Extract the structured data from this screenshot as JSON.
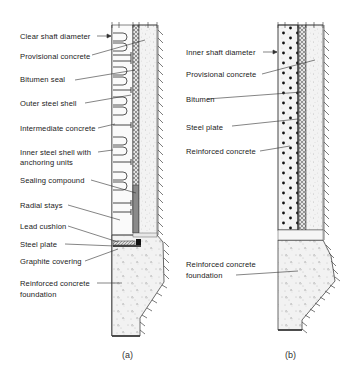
{
  "figure_a": {
    "caption": "(a)",
    "labels": [
      {
        "id": "clear-shaft-diameter",
        "text": "Clear shaft diameter",
        "x": 20,
        "y": 23
      },
      {
        "id": "provisional-concrete",
        "text": "Provisional concrete",
        "x": 20,
        "y": 52
      },
      {
        "id": "bitumen-seal",
        "text": "Bitumen seal",
        "x": 20,
        "y": 75
      },
      {
        "id": "outer-steel-shell",
        "text": "Outer steel shell",
        "x": 20,
        "y": 99
      },
      {
        "id": "intermediate-concrete",
        "text": "Intermediate concrete",
        "x": 20,
        "y": 124
      },
      {
        "id": "inner-steel-shell",
        "text": "Inner steel shell with",
        "x": 20,
        "y": 149
      },
      {
        "id": "inner-steel-shell-2",
        "text": "anchoring units",
        "x": 20,
        "y": 159
      },
      {
        "id": "sealing-compound",
        "text": "Sealing compound",
        "x": 20,
        "y": 176
      },
      {
        "id": "radial-stays",
        "text": "Radial stays",
        "x": 20,
        "y": 200
      },
      {
        "id": "lead-cushion",
        "text": "Lead cushion",
        "x": 20,
        "y": 222
      },
      {
        "id": "steel-plate",
        "text": "Steel plate",
        "x": 20,
        "y": 239
      },
      {
        "id": "graphite-covering",
        "text": "Graphite covering",
        "x": 20,
        "y": 256
      },
      {
        "id": "foundation-1",
        "text": "Reinforced concrete",
        "x": 20,
        "y": 278
      },
      {
        "id": "foundation-2",
        "text": "foundation",
        "x": 20,
        "y": 289
      }
    ]
  },
  "figure_b": {
    "caption": "(b)",
    "labels": [
      {
        "id": "inner-shaft-diameter",
        "text": "Inner shaft diameter",
        "x": 186,
        "y": 48
      },
      {
        "id": "provisional-concrete",
        "text": "Provisional concrete",
        "x": 186,
        "y": 70
      },
      {
        "id": "bitumen",
        "text": "Bitumen",
        "x": 186,
        "y": 96
      },
      {
        "id": "steel-plate",
        "text": "Steel plate",
        "x": 186,
        "y": 123
      },
      {
        "id": "reinforced-concrete",
        "text": "Reinforced concrete",
        "x": 186,
        "y": 148
      },
      {
        "id": "foundation-1",
        "text": "Reinforced concrete",
        "x": 186,
        "y": 259
      },
      {
        "id": "foundation-2",
        "text": "foundation",
        "x": 186,
        "y": 270
      }
    ]
  }
}
